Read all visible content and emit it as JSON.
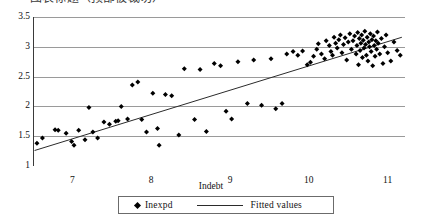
{
  "title": {
    "text": "图表标题（顶部被裁切）",
    "visible_fragment": true
  },
  "chart_data": {
    "type": "scatter",
    "title": "",
    "xlabel": "Indebt",
    "ylabel": "",
    "xlim": [
      6.5,
      11.22
    ],
    "ylim": [
      1.0,
      3.5
    ],
    "xticks": [
      7,
      8,
      9,
      10,
      11
    ],
    "xticklabels": [
      "7",
      "8",
      "9",
      "10",
      "11"
    ],
    "yticks": [
      1,
      1.5,
      2,
      2.5,
      3,
      3.5
    ],
    "yticklabels": [
      "1",
      "1.5",
      "2",
      "2.5",
      "3",
      "3.5"
    ],
    "grid": "horizontal",
    "legend_position": "below-axis",
    "legend": [
      {
        "name": "Inexpd",
        "marker": "diamond",
        "color": "#000000"
      },
      {
        "name": "Fitted values",
        "marker": "line",
        "color": "#2b2b2b"
      }
    ],
    "series": [
      {
        "name": "Inexpd",
        "type": "scatter",
        "marker": "diamond",
        "color": "#000000",
        "points": [
          [
            6.55,
            1.38
          ],
          [
            6.62,
            1.47
          ],
          [
            6.78,
            1.61
          ],
          [
            6.82,
            1.6
          ],
          [
            6.92,
            1.55
          ],
          [
            6.99,
            1.41
          ],
          [
            7.02,
            1.35
          ],
          [
            7.08,
            1.6
          ],
          [
            7.16,
            1.44
          ],
          [
            7.21,
            1.98
          ],
          [
            7.26,
            1.57
          ],
          [
            7.32,
            1.47
          ],
          [
            7.4,
            1.74
          ],
          [
            7.47,
            1.7
          ],
          [
            7.55,
            1.75
          ],
          [
            7.58,
            1.76
          ],
          [
            7.62,
            2.0
          ],
          [
            7.7,
            1.79
          ],
          [
            7.76,
            2.36
          ],
          [
            7.83,
            2.41
          ],
          [
            7.88,
            1.78
          ],
          [
            7.94,
            1.57
          ],
          [
            8.02,
            2.22
          ],
          [
            8.08,
            1.63
          ],
          [
            8.1,
            1.35
          ],
          [
            8.18,
            2.2
          ],
          [
            8.26,
            2.18
          ],
          [
            8.35,
            1.52
          ],
          [
            8.42,
            2.63
          ],
          [
            8.55,
            1.78
          ],
          [
            8.62,
            2.62
          ],
          [
            8.7,
            1.58
          ],
          [
            8.8,
            2.72
          ],
          [
            8.88,
            2.68
          ],
          [
            8.95,
            1.92
          ],
          [
            9.02,
            1.79
          ],
          [
            9.1,
            2.75
          ],
          [
            9.22,
            2.05
          ],
          [
            9.3,
            2.78
          ],
          [
            9.4,
            2.02
          ],
          [
            9.52,
            2.8
          ],
          [
            9.58,
            1.96
          ],
          [
            9.66,
            2.05
          ],
          [
            9.72,
            2.88
          ],
          [
            9.8,
            2.92
          ],
          [
            9.86,
            2.86
          ],
          [
            9.92,
            2.93
          ],
          [
            9.98,
            2.7
          ],
          [
            10.02,
            2.74
          ],
          [
            10.06,
            2.84
          ],
          [
            10.1,
            2.96
          ],
          [
            10.12,
            3.05
          ],
          [
            10.16,
            2.88
          ],
          [
            10.2,
            2.8
          ],
          [
            10.22,
            3.1
          ],
          [
            10.26,
            3.02
          ],
          [
            10.28,
            2.92
          ],
          [
            10.3,
            2.86
          ],
          [
            10.32,
            3.16
          ],
          [
            10.34,
            3.06
          ],
          [
            10.36,
            2.98
          ],
          [
            10.38,
            3.12
          ],
          [
            10.4,
            3.2
          ],
          [
            10.42,
            2.9
          ],
          [
            10.44,
            3.04
          ],
          [
            10.46,
            3.15
          ],
          [
            10.48,
            2.78
          ],
          [
            10.5,
            3.08
          ],
          [
            10.52,
            3.22
          ],
          [
            10.54,
            2.96
          ],
          [
            10.56,
            3.1
          ],
          [
            10.58,
            3.18
          ],
          [
            10.6,
            2.88
          ],
          [
            10.61,
            3.02
          ],
          [
            10.62,
            3.24
          ],
          [
            10.63,
            2.7
          ],
          [
            10.64,
            3.14
          ],
          [
            10.65,
            2.94
          ],
          [
            10.66,
            3.06
          ],
          [
            10.67,
            3.2
          ],
          [
            10.68,
            2.82
          ],
          [
            10.69,
            3.11
          ],
          [
            10.7,
            2.98
          ],
          [
            10.71,
            3.26
          ],
          [
            10.72,
            3.04
          ],
          [
            10.73,
            2.86
          ],
          [
            10.74,
            3.16
          ],
          [
            10.75,
            2.76
          ],
          [
            10.76,
            3.08
          ],
          [
            10.77,
            3.0
          ],
          [
            10.78,
            3.22
          ],
          [
            10.79,
            2.92
          ],
          [
            10.8,
            3.12
          ],
          [
            10.81,
            2.68
          ],
          [
            10.82,
            3.18
          ],
          [
            10.83,
            3.02
          ],
          [
            10.84,
            2.84
          ],
          [
            10.85,
            3.1
          ],
          [
            10.86,
            2.96
          ],
          [
            10.87,
            3.25
          ],
          [
            10.88,
            3.06
          ],
          [
            10.9,
            2.88
          ],
          [
            10.92,
            3.14
          ],
          [
            10.94,
            2.72
          ],
          [
            10.96,
            3.0
          ],
          [
            10.98,
            3.2
          ],
          [
            11.0,
            2.9
          ],
          [
            11.04,
            2.76
          ],
          [
            11.08,
            3.08
          ],
          [
            11.12,
            2.94
          ],
          [
            11.16,
            2.86
          ]
        ]
      },
      {
        "name": "Fitted values",
        "type": "line",
        "color": "#2b2b2b",
        "points": [
          [
            6.52,
            1.26
          ],
          [
            11.18,
            3.16
          ]
        ]
      }
    ]
  },
  "axis": {
    "x_title": "Indebt"
  },
  "legend": {
    "marker_entry": "Inexpd",
    "line_entry": "Fitted values"
  }
}
